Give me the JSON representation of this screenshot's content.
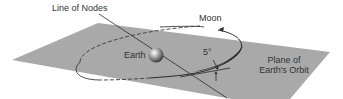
{
  "diagram": {
    "labels": {
      "line_of_nodes": "Line of Nodes",
      "moon": "Moon",
      "earth": "Earth",
      "angle": "5°",
      "plane_line1": "Plane of",
      "plane_line2": "Earth's Orbit"
    },
    "colors": {
      "plane": "#a9a9a9",
      "orbit": "#333333",
      "text": "#333333",
      "background": "#ffffff"
    },
    "inclination_degrees": 5
  }
}
